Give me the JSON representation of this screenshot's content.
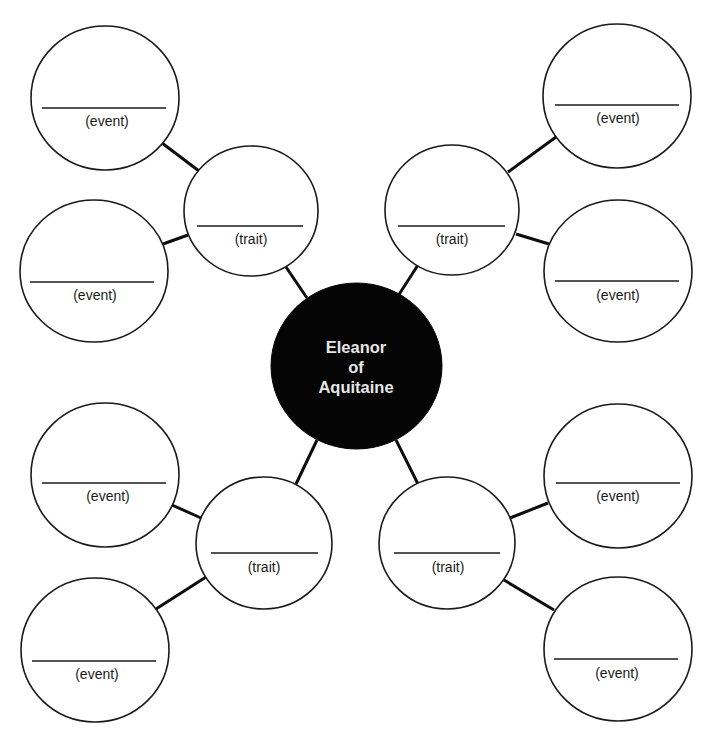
{
  "diagram": {
    "type": "character-web",
    "center": {
      "lines": [
        "Eleanor",
        "of",
        "Aquitaine"
      ],
      "fill": "#050505",
      "text_color": "#e6e6e6"
    },
    "branches": [
      {
        "position": "top-left",
        "trait": {
          "label": "(trait)",
          "answer": ""
        },
        "events": [
          {
            "label": "(event)",
            "answer": ""
          },
          {
            "label": "(event)",
            "answer": ""
          }
        ]
      },
      {
        "position": "top-right",
        "trait": {
          "label": "(trait)",
          "answer": ""
        },
        "events": [
          {
            "label": "(event)",
            "answer": ""
          },
          {
            "label": "(event)",
            "answer": ""
          }
        ]
      },
      {
        "position": "bottom-left",
        "trait": {
          "label": "(trait)",
          "answer": ""
        },
        "events": [
          {
            "label": "(event)",
            "answer": ""
          },
          {
            "label": "(event)",
            "answer": ""
          }
        ]
      },
      {
        "position": "bottom-right",
        "trait": {
          "label": "(trait)",
          "answer": ""
        },
        "events": [
          {
            "label": "(event)",
            "answer": ""
          },
          {
            "label": "(event)",
            "answer": ""
          }
        ]
      }
    ]
  }
}
